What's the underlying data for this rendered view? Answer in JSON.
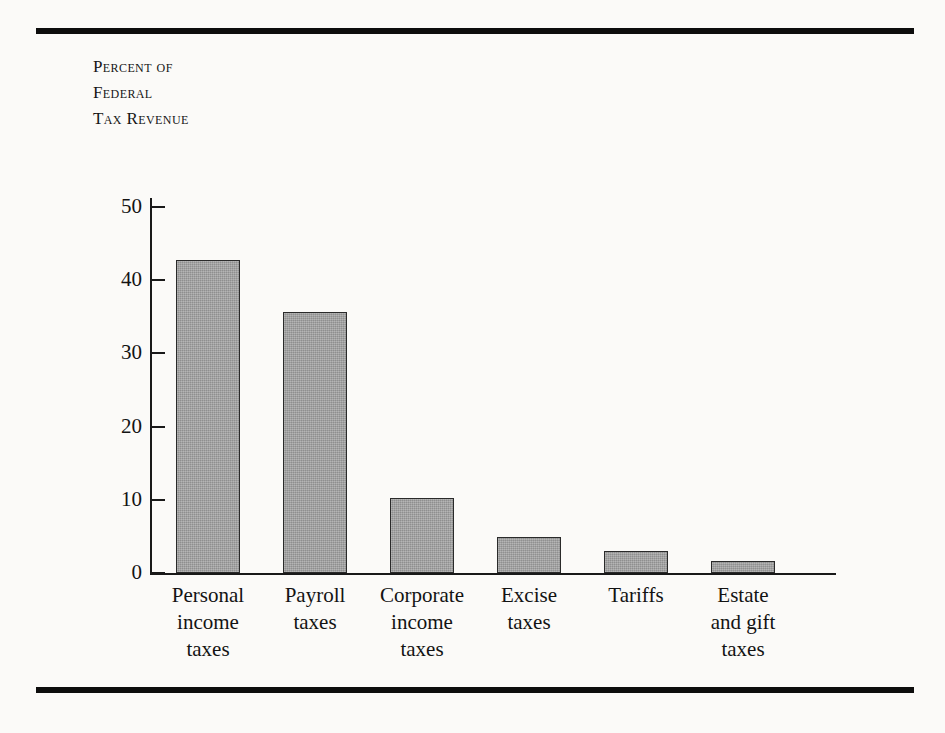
{
  "figure": {
    "background_color": "#fbfaf8",
    "rule_color": "#0d0d0d",
    "axis_color": "#191919",
    "bar_fill_color": "#a0a0a0",
    "bar_edge_color": "#2a2a2a"
  },
  "axis_title": {
    "lines": [
      "Percent of",
      "Federal",
      "Tax Revenue"
    ]
  },
  "chart_data": {
    "type": "bar",
    "title": "",
    "subtitle": "",
    "xlabel": "",
    "ylabel": "Percent of Federal Tax Revenue",
    "categories": [
      "Personal income taxes",
      "Payroll taxes",
      "Corporate income taxes",
      "Excise taxes",
      "Tariffs",
      "Estate and gift taxes"
    ],
    "category_label_lines": [
      [
        "Personal",
        "income",
        "taxes"
      ],
      [
        "Payroll",
        "taxes"
      ],
      [
        "Corporate",
        "income",
        "taxes"
      ],
      [
        "Excise",
        "taxes"
      ],
      [
        "Tariffs"
      ],
      [
        "Estate",
        "and gift",
        "taxes"
      ]
    ],
    "values": [
      42.7,
      35.7,
      10.2,
      4.9,
      3.0,
      1.6
    ],
    "ylim": [
      0,
      53
    ],
    "yticks": [
      0,
      10,
      20,
      30,
      40,
      50
    ],
    "ytick_labels": [
      "0",
      "10",
      "20",
      "30",
      "40",
      "50"
    ],
    "grid": false,
    "legend": null
  }
}
